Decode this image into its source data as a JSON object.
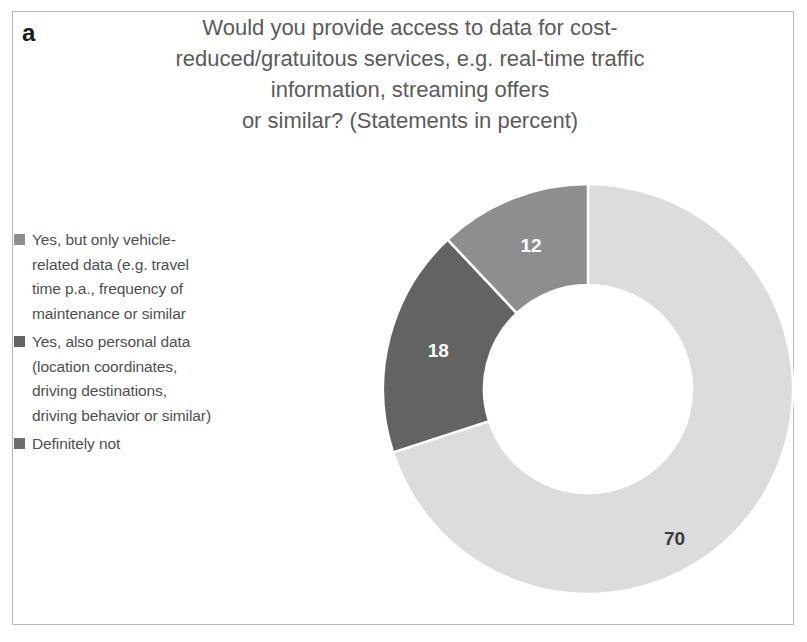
{
  "panel": {
    "label": "a"
  },
  "chart_data": {
    "type": "pie",
    "variant": "donut",
    "title_lines": [
      "Would you provide access to data for cost-",
      "reduced/gratuitous services, e.g. real-time traffic",
      "information, streaming offers",
      "or similar? (Statements in percent)"
    ],
    "unit": "percent",
    "categories": [
      "Yes, but only vehicle-related data (e.g. travel time p.a., frequency of maintenance or similar",
      "Yes, also personal data (location coordinates, driving destinations, driving behavior or similar)",
      "Definitely not"
    ],
    "values": [
      12,
      18,
      70
    ],
    "colors": [
      "#8e8e8e",
      "#636363",
      "#dcdcdc"
    ],
    "slice_label_colors": [
      "#ffffff",
      "#ffffff",
      "#3a3a3a"
    ],
    "draw_order_clockwise_from_top": [
      "Definitely not",
      "Yes, also personal data",
      "Yes, but only vehicle-related data"
    ],
    "legend": {
      "position": "left",
      "entries": [
        {
          "swatch_color": "#8e8e8e",
          "lines": [
            "Yes, but only vehicle-",
            "related data (e.g. travel",
            "time p.a., frequency of",
            "maintenance or similar"
          ]
        },
        {
          "swatch_color": "#636363",
          "lines": [
            "Yes, also personal data",
            "(location coordinates,",
            "driving destinations,",
            "driving behavior or similar)"
          ]
        },
        {
          "swatch_color": "#6e6e6e",
          "lines": [
            "Definitely not"
          ]
        }
      ]
    },
    "data_labels": [
      {
        "text": "12",
        "value": 12
      },
      {
        "text": "18",
        "value": 18
      },
      {
        "text": "70",
        "value": 70
      }
    ],
    "grid": false,
    "xlabel": "",
    "ylabel": ""
  }
}
